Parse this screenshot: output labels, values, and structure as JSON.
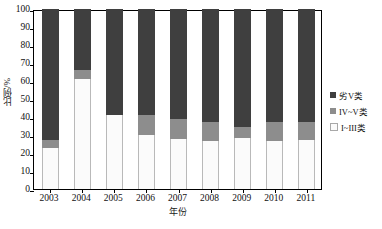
{
  "chart_data": {
    "type": "bar",
    "stacked": true,
    "title": "",
    "xlabel": "年份",
    "ylabel": "比例/%",
    "categories": [
      "2003",
      "2004",
      "2005",
      "2006",
      "2007",
      "2008",
      "2009",
      "2010",
      "2011"
    ],
    "ylim": [
      0,
      100
    ],
    "yticks": [
      0,
      10,
      20,
      30,
      40,
      50,
      60,
      70,
      80,
      90,
      100
    ],
    "grid": false,
    "legend_position": "right",
    "series": [
      {
        "name": "劣V类",
        "color": "#3f3f3f",
        "values": [
          73,
          34,
          59,
          59,
          61,
          63,
          65.5,
          63,
          62.5
        ]
      },
      {
        "name": "IV~V类",
        "color": "#8d8d8d",
        "values": [
          4,
          5,
          0,
          11,
          11,
          10.5,
          6,
          10.5,
          10
        ]
      },
      {
        "name": "I~III类",
        "color": "#fbfbfb",
        "values": [
          23,
          61,
          41,
          30,
          28,
          26.5,
          28.5,
          26.5,
          27.5
        ]
      }
    ]
  },
  "axes": {
    "y_title": "比例/%",
    "x_title": "年份",
    "y_tick_labels": [
      "100",
      "90",
      "80",
      "70",
      "60",
      "50",
      "40",
      "30",
      "20",
      "10",
      "0"
    ],
    "x_tick_labels": [
      "2003",
      "2004",
      "2005",
      "2006",
      "2007",
      "2008",
      "2009",
      "2010",
      "2011"
    ]
  },
  "legend": {
    "items": [
      {
        "label": "劣V类",
        "color": "#3f3f3f"
      },
      {
        "label": "IV~V类",
        "color": "#8d8d8d"
      },
      {
        "label": "I~III类",
        "color": "#fbfbfb"
      }
    ]
  }
}
